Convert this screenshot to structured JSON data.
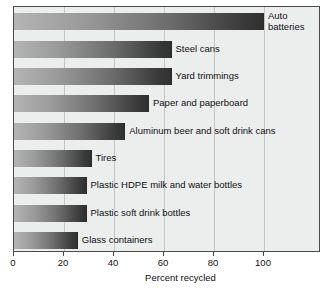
{
  "chart_data": {
    "type": "bar",
    "orientation": "horizontal",
    "title": "",
    "xlabel": "Percent recycled",
    "ylabel": "",
    "xlim": [
      0,
      122
    ],
    "xticks": [
      0,
      20,
      40,
      60,
      80,
      100
    ],
    "xtick_labels": [
      "0",
      "20",
      "40",
      "60",
      "80",
      "100"
    ],
    "grid": "vertical",
    "legend": "none",
    "categories": [
      "Auto batteries",
      "Steel cans",
      "Yard trimmings",
      "Paper and paperboard",
      "Aluminum beer and soft drink cans",
      "Tires",
      "Plastic HDPE milk and water bottles",
      "Plastic soft drink bottles",
      "Glass containers"
    ],
    "values": [
      100,
      63,
      63,
      54,
      44.5,
      31,
      29,
      29,
      25.5
    ],
    "bar_gradient_from": "#b4b4b4",
    "bar_gradient_to": "#303030",
    "plot_background": "#eceded",
    "grid_color": "#c3c4c4",
    "frame_color": "#4a4a4a",
    "text_color": "#111111",
    "wrapped_labels": [
      "Auto batteries"
    ]
  }
}
